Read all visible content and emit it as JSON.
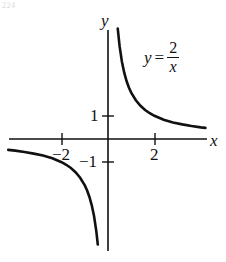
{
  "figure": {
    "background_color": "#ffffff",
    "ink_color": "#111111",
    "corner_mark": "224"
  },
  "axes": {
    "x_label": "x",
    "y_label": "y",
    "x_ticks": [
      {
        "value": -2,
        "label": "−2"
      },
      {
        "value": 2,
        "label": "2"
      }
    ],
    "y_ticks": [
      {
        "value": 1,
        "label": "1"
      },
      {
        "value": -1,
        "label": "−1"
      }
    ]
  },
  "annotation": {
    "lhs": "y",
    "equals": "=",
    "numerator": "2",
    "denominator": "x"
  },
  "chart_data": {
    "type": "line",
    "xlabel": "x",
    "ylabel": "y",
    "xlim": [
      -4.3,
      4.2
    ],
    "ylim": [
      -4.8,
      4.7
    ],
    "grid": false,
    "legend": null,
    "annotations": [
      {
        "text": "y = 2/x",
        "x": 2.4,
        "y": 3.4
      }
    ],
    "xticks": [
      -2,
      2
    ],
    "xticklabels": [
      "−2",
      "2"
    ],
    "yticks": [
      -1,
      1
    ],
    "yticklabels": [
      "−1",
      "1"
    ],
    "series": [
      {
        "name": "y = 2/x (x > 0)",
        "equation": "y = 2/x",
        "branch": "positive",
        "x": [
          0.42,
          0.5,
          0.6,
          0.7,
          0.8,
          0.9,
          1.0,
          1.2,
          1.4,
          1.6,
          1.8,
          2.0,
          2.4,
          2.8,
          3.2,
          3.6,
          4.0,
          4.2
        ],
        "y": [
          4.76,
          4.0,
          3.33,
          2.86,
          2.5,
          2.22,
          2.0,
          1.67,
          1.43,
          1.25,
          1.11,
          1.0,
          0.83,
          0.71,
          0.63,
          0.56,
          0.5,
          0.48
        ]
      },
      {
        "name": "y = 2/x (x < 0)",
        "equation": "y = 2/x",
        "branch": "negative",
        "x": [
          -4.3,
          -4.0,
          -3.6,
          -3.2,
          -2.8,
          -2.4,
          -2.0,
          -1.8,
          -1.6,
          -1.4,
          -1.2,
          -1.0,
          -0.9,
          -0.8,
          -0.7,
          -0.6,
          -0.5,
          -0.44
        ],
        "y": [
          -0.47,
          -0.5,
          -0.56,
          -0.63,
          -0.71,
          -0.83,
          -1.0,
          -1.11,
          -1.25,
          -1.43,
          -1.67,
          -2.0,
          -2.22,
          -2.5,
          -2.86,
          -3.33,
          -4.0,
          -4.55
        ]
      }
    ]
  }
}
